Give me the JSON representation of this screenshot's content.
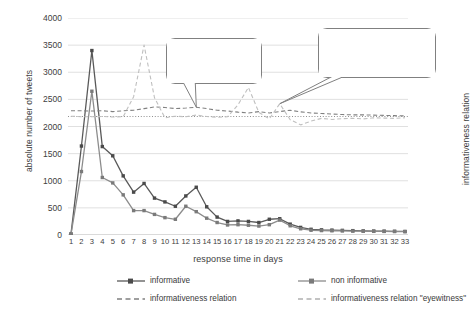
{
  "chart_data": {
    "type": "line",
    "title": "",
    "xlabel": "response time in days",
    "ylabel": "absolute number of tweets",
    "y2label": "informativeness relation",
    "xlim": [
      1,
      33
    ],
    "ylim": [
      0,
      4000
    ],
    "ytick_values": [
      0,
      500,
      1000,
      1500,
      2000,
      2500,
      3000,
      3500,
      4000
    ],
    "ytick_labels": [
      "0",
      "500",
      "1000",
      "1500",
      "2000",
      "2500",
      "3000",
      "3500",
      "4000"
    ],
    "x": [
      1,
      2,
      3,
      4,
      5,
      6,
      7,
      8,
      9,
      10,
      11,
      12,
      13,
      14,
      15,
      16,
      17,
      18,
      19,
      20,
      21,
      22,
      23,
      24,
      25,
      26,
      27,
      28,
      29,
      30,
      31,
      32,
      33
    ],
    "xtick_labels": [
      "1",
      "2",
      "3",
      "4",
      "5",
      "6",
      "7",
      "8",
      "9",
      "10",
      "11",
      "12",
      "13",
      "14",
      "15",
      "16",
      "17",
      "18",
      "19",
      "20",
      "21",
      "22",
      "23",
      "24",
      "25",
      "26",
      "27",
      "28",
      "29",
      "30",
      "31",
      "32",
      "33"
    ],
    "grid": true,
    "grid_axis": "y",
    "legend_position": "bottom",
    "series": [
      {
        "name": "informative",
        "style": "solid",
        "marker": "square",
        "color": "#595959",
        "axis": "left",
        "values": [
          20,
          1640,
          3400,
          1630,
          1460,
          1090,
          790,
          950,
          680,
          610,
          530,
          720,
          880,
          520,
          330,
          250,
          260,
          250,
          230,
          290,
          300,
          200,
          140,
          105,
          95,
          90,
          85,
          80,
          75,
          72,
          70,
          68,
          65
        ]
      },
      {
        "name": "non informative",
        "style": "solid",
        "marker": "square",
        "color": "#8c8c8c",
        "axis": "left",
        "values": [
          15,
          1170,
          2650,
          1060,
          960,
          740,
          450,
          450,
          380,
          320,
          290,
          530,
          430,
          310,
          230,
          185,
          190,
          180,
          165,
          190,
          275,
          170,
          115,
          88,
          82,
          78,
          75,
          72,
          70,
          68,
          66,
          64,
          62
        ]
      },
      {
        "name": "informativeness relation",
        "style": "dashed",
        "marker": "none",
        "color": "#808080",
        "axis": "right",
        "values": [
          2290,
          2290,
          2285,
          2290,
          2275,
          2290,
          2300,
          2330,
          2360,
          2350,
          2330,
          2340,
          2355,
          2330,
          2300,
          2285,
          2265,
          2250,
          2275,
          2250,
          2275,
          2300,
          2270,
          2250,
          2240,
          2230,
          2220,
          2215,
          2215,
          2210,
          2205,
          2200,
          2195
        ]
      },
      {
        "name": "informativeness relation \"eyewitness\"",
        "style": "dashed",
        "marker": "none",
        "color": "#bfbfbf",
        "axis": "right",
        "values": [
          2190,
          2180,
          2180,
          2185,
          2175,
          2180,
          2550,
          3500,
          2530,
          2160,
          2190,
          2180,
          2210,
          2185,
          2170,
          2180,
          2400,
          2720,
          2260,
          2140,
          2420,
          2125,
          2030,
          2100,
          2150,
          2130,
          2145,
          2150,
          2140,
          2160,
          2155,
          2150,
          2160
        ]
      }
    ],
    "reference_line": {
      "name": "constant informativeness baseline",
      "style": "dotted",
      "color": "#909090",
      "value": 2185
    },
    "annotations": [
      {
        "name": "callout-constant",
        "text": "constant informativeness relation over time over all tweets",
        "lines": [
          "constant",
          "informativeness",
          "relation over time",
          "over all tweets"
        ],
        "points_to_x": 13
      },
      {
        "name": "callout-nonconstant",
        "text": "non constant informativeness relation over time for \"eyewitness\" tweets",
        "lines": [
          "non constant",
          "informativeness relation",
          "over time for",
          "\"eyewitness\" tweets"
        ],
        "points_to_x": 21
      }
    ]
  },
  "legend": {
    "items": [
      {
        "label": "informative",
        "style": "solid-marker",
        "color": "#595959"
      },
      {
        "label": "non informative",
        "style": "solid-marker",
        "color": "#8c8c8c"
      },
      {
        "label": "informativeness relation",
        "style": "dashed",
        "color": "#808080"
      },
      {
        "label": "informativeness relation \"eyewitness\"",
        "style": "dashed",
        "color": "#b0b0b0"
      }
    ]
  }
}
